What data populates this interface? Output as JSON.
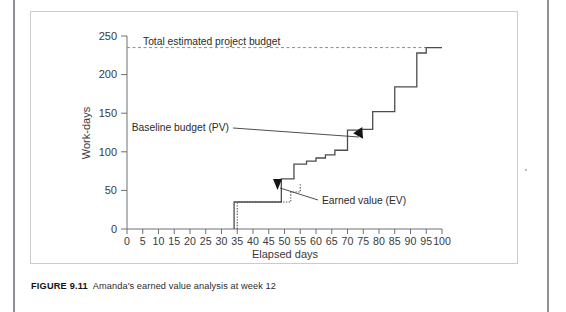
{
  "figure": {
    "label": "FIGURE 9.11",
    "caption": "Amanda's earned value analysis at week 12"
  },
  "chart_data": {
    "type": "line",
    "subtype": "step",
    "title": "",
    "xlabel": "Elapsed days",
    "ylabel": "Work-days",
    "xlim": [
      0,
      100
    ],
    "ylim": [
      0,
      250
    ],
    "xticks": [
      0,
      5,
      10,
      15,
      20,
      25,
      30,
      35,
      40,
      45,
      50,
      55,
      60,
      65,
      70,
      75,
      80,
      85,
      90,
      95,
      100
    ],
    "yticks": [
      0,
      50,
      100,
      150,
      200,
      250
    ],
    "grid": false,
    "legend_position": "annotations",
    "annotations": [
      {
        "name": "total-budget-label",
        "text": "Total estimated project budget",
        "x": 5,
        "y": 248
      },
      {
        "name": "baseline-budget-label",
        "text": "Baseline budget (PV)",
        "x": 33,
        "y": 148,
        "arrow_to_x": 73,
        "arrow_to_y": 128
      },
      {
        "name": "earned-value-label",
        "text": "Earned value (EV)",
        "x": 62,
        "y": 32,
        "arrow_to_x": 55,
        "arrow_to_y": 52
      }
    ],
    "reference_lines": [
      {
        "name": "total-estimated-project-budget",
        "label": "Total estimated project budget",
        "orientation": "horizontal",
        "value": 235,
        "style": "dashed"
      }
    ],
    "series": [
      {
        "name": "Baseline budget (PV)",
        "short_name": "PV",
        "style": "solid",
        "color": "#4d4d4d",
        "x": [
          34,
          34,
          49,
          49,
          53,
          53,
          57,
          57,
          60,
          60,
          63,
          63,
          66,
          66,
          70,
          70,
          74,
          74,
          78,
          78,
          85,
          85,
          92,
          92,
          95,
          95,
          100
        ],
        "y": [
          0,
          35,
          35,
          65,
          65,
          84,
          84,
          88,
          88,
          92,
          92,
          96,
          96,
          102,
          102,
          128,
          128,
          129,
          129,
          152,
          152,
          184,
          184,
          228,
          228,
          235,
          235
        ],
        "steps": [
          {
            "day": 34,
            "value": 35
          },
          {
            "day": 49,
            "value": 65
          },
          {
            "day": 53,
            "value": 84
          },
          {
            "day": 57,
            "value": 88
          },
          {
            "day": 60,
            "value": 92
          },
          {
            "day": 63,
            "value": 96
          },
          {
            "day": 66,
            "value": 102
          },
          {
            "day": 70,
            "value": 128
          },
          {
            "day": 74,
            "value": 129
          },
          {
            "day": 78,
            "value": 152
          },
          {
            "day": 85,
            "value": 184
          },
          {
            "day": 92,
            "value": 228
          },
          {
            "day": 95,
            "value": 235
          }
        ]
      },
      {
        "name": "Earned value (EV)",
        "short_name": "EV",
        "style": "dotted",
        "color": "#555555",
        "x": [
          35,
          35,
          52,
          52,
          55,
          55
        ],
        "y": [
          0,
          35,
          35,
          48,
          48,
          58
        ],
        "steps": [
          {
            "day": 35,
            "value": 35
          },
          {
            "day": 52,
            "value": 48
          },
          {
            "day": 55,
            "value": 58
          }
        ]
      }
    ]
  },
  "axis": {
    "x_label": "Elapsed days",
    "y_label": "Work-days",
    "x_tick_labels": [
      "0",
      "5",
      "10",
      "15",
      "20",
      "25",
      "30",
      "35",
      "40",
      "45",
      "50",
      "55",
      "60",
      "65",
      "70",
      "75",
      "80",
      "85",
      "90",
      "95",
      "100"
    ],
    "y_tick_labels": [
      "0",
      "50",
      "100",
      "150",
      "200",
      "250"
    ]
  },
  "colors": {
    "axis": "#6e7175",
    "series_pv": "#4d4d4d",
    "series_ev": "#555555",
    "budget_line": "#8a8d91",
    "text": "#3a3a3a",
    "frame": "#c9cbcd",
    "gutter": "#8d9096"
  }
}
